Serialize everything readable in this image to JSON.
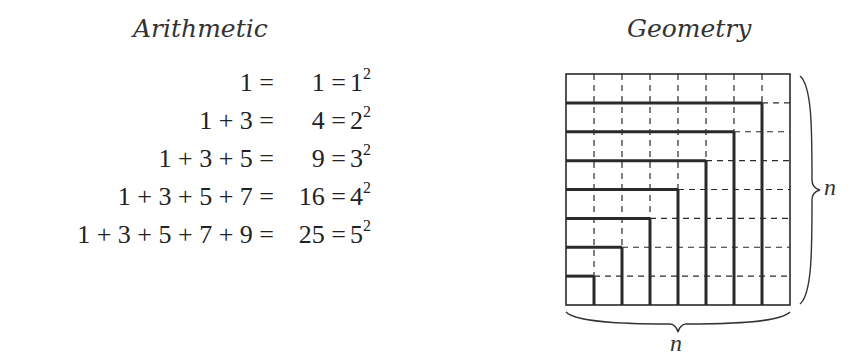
{
  "arithmetic": {
    "title": "Arithmetic",
    "rows": [
      {
        "lhs": "1 =",
        "sum": "1",
        "base": "1",
        "exp": "2"
      },
      {
        "lhs": "1 + 3 =",
        "sum": "4",
        "base": "2",
        "exp": "2"
      },
      {
        "lhs": "1 + 3 + 5 =",
        "sum": "9",
        "base": "3",
        "exp": "2"
      },
      {
        "lhs": "1 + 3 + 5 + 7 =",
        "sum": "16",
        "base": "4",
        "exp": "2"
      },
      {
        "lhs": "1 + 3 + 5 + 7 + 9 =",
        "sum": "25",
        "base": "5",
        "exp": "2"
      }
    ]
  },
  "geometry": {
    "title": "Geometry",
    "grid_size": 8,
    "side_label_right": "n",
    "side_label_bottom": "n",
    "colors": {
      "line": "#2a2a2a",
      "thick": "#1a1a1a"
    }
  }
}
